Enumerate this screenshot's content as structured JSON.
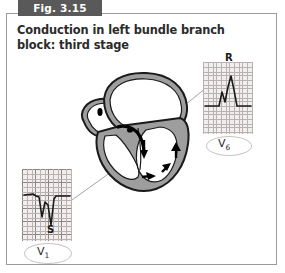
{
  "figure": {
    "banner_label": "Fig. 3.15",
    "title": "Conduction in left bundle branch block: third stage",
    "banner_color": "#595959",
    "frame_color": "#9a9a9a"
  },
  "heart": {
    "name": "heart-cross-section",
    "wall_color": "#9e9e9e",
    "outline_color": "#1a1a1a",
    "chamber_color": "#ffffff",
    "arrow_color": "#000000",
    "nodes": [
      {
        "name": "sinoatrial-node",
        "label": ""
      },
      {
        "name": "atrioventricular-node",
        "label": ""
      }
    ],
    "conduction_arrows": [
      {
        "name": "septal-arrow",
        "direction": "down-right"
      },
      {
        "name": "lv-apex-arrow",
        "direction": "right"
      },
      {
        "name": "lv-lower-wall-arrow",
        "direction": "up-right"
      },
      {
        "name": "lv-upper-wall-arrow",
        "direction": "up"
      }
    ]
  },
  "ecg_panels": [
    {
      "id": "v6",
      "lead_label": "V",
      "lead_subscript": "6",
      "wave_label": "R",
      "grid_major_color": "#8d8484",
      "grid_minor_color": "#b9b2b2",
      "grid_background": "#f2eeee",
      "trace_color": "#1a1a1a",
      "description": "notched M-shaped tall R wave"
    },
    {
      "id": "v1",
      "lead_label": "V",
      "lead_subscript": "1",
      "wave_label": "S",
      "grid_major_color": "#8d8484",
      "grid_minor_color": "#b9b2b2",
      "grid_background": "#f2eeee",
      "trace_color": "#1a1a1a",
      "description": "deep broad W-shaped S wave"
    }
  ],
  "leader_lines": [
    {
      "name": "leader-line-to-v6",
      "from": "left-ventricle-wall",
      "to": "v6-panel"
    },
    {
      "name": "leader-line-to-v1",
      "from": "heart-lower-region",
      "to": "v1-panel"
    }
  ]
}
